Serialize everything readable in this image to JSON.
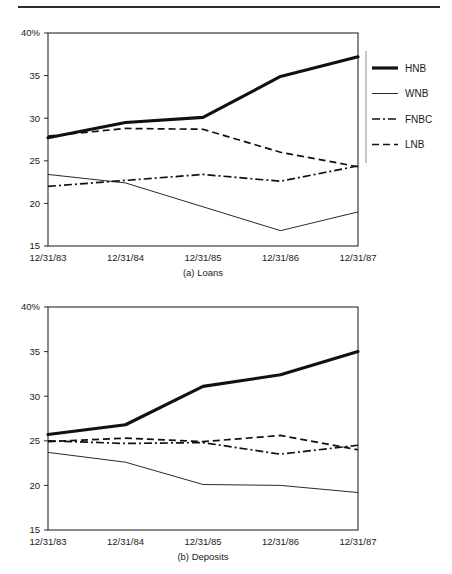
{
  "figure": {
    "has_top_rule": true,
    "background": "#ffffff",
    "ink_color": "#111111"
  },
  "legend": {
    "position": "right-of-top-chart",
    "entries": [
      {
        "label": "HNB",
        "style": "thick-solid"
      },
      {
        "label": "WNB",
        "style": "thin-solid"
      },
      {
        "label": "FNBC",
        "style": "dash-dot"
      },
      {
        "label": "LNB",
        "style": "dashed"
      }
    ]
  },
  "chart_data": [
    {
      "type": "line",
      "title": "(a) Loans",
      "xlabel": "",
      "ylabel": "",
      "grid": false,
      "legend_position": "right",
      "categories": [
        "12/31/83",
        "12/31/84",
        "12/31/85",
        "12/31/86",
        "12/31/87"
      ],
      "ytick_labels": [
        "40%",
        "35",
        "30",
        "25",
        "20",
        "15"
      ],
      "yticks": [
        40,
        35,
        30,
        25,
        20,
        15
      ],
      "ylim": [
        15,
        40
      ],
      "series": [
        {
          "name": "HNB",
          "style": "thick-solid",
          "values": [
            27.7,
            29.5,
            30.1,
            34.9,
            37.2
          ]
        },
        {
          "name": "WNB",
          "style": "thin-solid",
          "values": [
            23.4,
            22.4,
            19.6,
            16.8,
            19.0
          ]
        },
        {
          "name": "FNBC",
          "style": "dash-dot",
          "values": [
            22.0,
            22.7,
            23.4,
            22.6,
            24.4
          ]
        },
        {
          "name": "LNB",
          "style": "dashed",
          "values": [
            27.9,
            28.8,
            28.7,
            26.0,
            24.3
          ]
        }
      ]
    },
    {
      "type": "line",
      "title": "(b) Deposits",
      "xlabel": "",
      "ylabel": "",
      "grid": false,
      "legend_position": "none",
      "categories": [
        "12/31/83",
        "12/31/84",
        "12/31/85",
        "12/31/86",
        "12/31/87"
      ],
      "ytick_labels": [
        "40%",
        "35",
        "30",
        "25",
        "20",
        "15"
      ],
      "yticks": [
        40,
        35,
        30,
        25,
        20,
        15
      ],
      "ylim": [
        15,
        40
      ],
      "series": [
        {
          "name": "HNB",
          "style": "thick-solid",
          "values": [
            25.7,
            26.8,
            31.1,
            32.4,
            35.0
          ]
        },
        {
          "name": "WNB",
          "style": "thin-solid",
          "values": [
            23.7,
            22.6,
            20.1,
            20.0,
            19.2
          ]
        },
        {
          "name": "FNBC",
          "style": "dash-dot",
          "values": [
            25.0,
            24.7,
            24.8,
            23.5,
            24.5
          ]
        },
        {
          "name": "LNB",
          "style": "dashed",
          "values": [
            24.9,
            25.3,
            24.9,
            25.6,
            24.0
          ]
        }
      ]
    }
  ]
}
